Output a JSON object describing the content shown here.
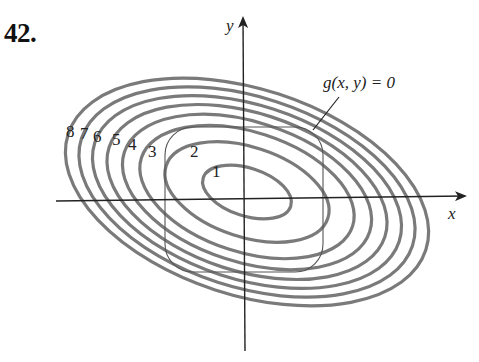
{
  "problem": {
    "number": "42."
  },
  "figure": {
    "axes": {
      "x_label": "x",
      "y_label": "y"
    },
    "constraint_label": "g(x, y) = 0",
    "contour_labels": [
      "1",
      "2",
      "3",
      "4",
      "5",
      "6",
      "7",
      "8"
    ],
    "contour_color": "#7a7a7a",
    "axis_color": "#222222"
  }
}
